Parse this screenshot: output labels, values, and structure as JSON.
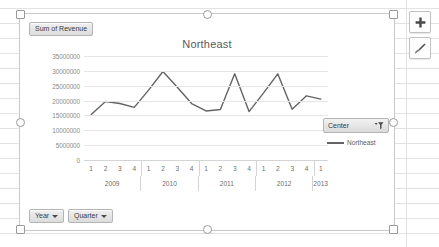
{
  "app": {
    "context": "excel-pivotchart",
    "accent_color": "#636363",
    "gridline_color": "#e6e6e6"
  },
  "chart_object": {
    "selected": true,
    "title": "Northeast",
    "pivot_buttons": {
      "values_field": "Sum of Revenue",
      "axis_field_year": "Year",
      "axis_field_quarter": "Quarter",
      "caret_icon": "caret-down-icon"
    },
    "legend": {
      "filter_button_label": "Center",
      "filter_icon": "funnel-filter-icon",
      "series_name": "Northeast"
    },
    "float_buttons": [
      {
        "name": "chart-elements",
        "icon": "plus-icon",
        "glyph": "+"
      },
      {
        "name": "chart-styles",
        "icon": "paintbrush-icon",
        "glyph": ""
      }
    ]
  },
  "chart_data": {
    "type": "line",
    "title": "Northeast",
    "xlabel": "",
    "ylabel": "",
    "ylim": [
      0,
      35000000
    ],
    "ytick_step": 5000000,
    "grid": true,
    "legend_position": "right",
    "ytick_labels": [
      "35000000",
      "30000000",
      "25000000",
      "20000000",
      "15000000",
      "10000000",
      "5000000",
      "0"
    ],
    "yticks": [
      35000000,
      30000000,
      25000000,
      20000000,
      15000000,
      10000000,
      5000000,
      0
    ],
    "year_groups": [
      {
        "year": "2009",
        "quarters": [
          "1",
          "2",
          "3",
          "4"
        ]
      },
      {
        "year": "2010",
        "quarters": [
          "1",
          "2",
          "3",
          "4"
        ]
      },
      {
        "year": "2011",
        "quarters": [
          "1",
          "2",
          "3",
          "4"
        ]
      },
      {
        "year": "2012",
        "quarters": [
          "1",
          "2",
          "3",
          "4"
        ]
      },
      {
        "year": "2013",
        "quarters": [
          "1"
        ]
      }
    ],
    "categories": [
      "2009 Q1",
      "2009 Q2",
      "2009 Q3",
      "2009 Q4",
      "2010 Q1",
      "2010 Q2",
      "2010 Q3",
      "2010 Q4",
      "2011 Q1",
      "2011 Q2",
      "2011 Q3",
      "2011 Q4",
      "2012 Q1",
      "2012 Q2",
      "2012 Q3",
      "2012 Q4",
      "2013 Q1"
    ],
    "series": [
      {
        "name": "Northeast",
        "color": "#636363",
        "values": [
          15300000,
          19700000,
          19000000,
          17700000,
          23500000,
          29800000,
          24500000,
          19000000,
          16500000,
          17000000,
          29000000,
          16300000,
          22500000,
          29000000,
          17100000,
          21600000,
          20500000
        ]
      }
    ]
  }
}
